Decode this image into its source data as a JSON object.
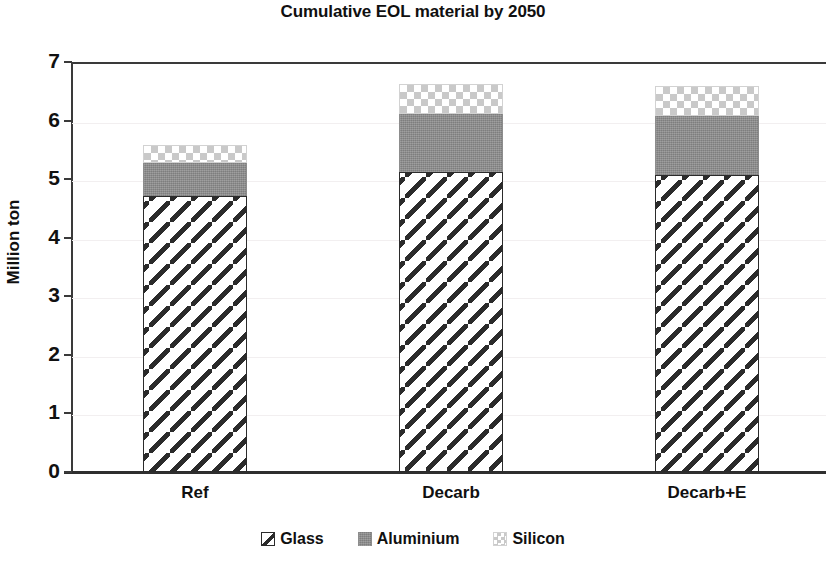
{
  "chart_data": {
    "type": "bar",
    "title": "Cumulative EOL material by 2050",
    "xlabel": "",
    "ylabel": "Million ton",
    "ylim": [
      0,
      7
    ],
    "yticks": [
      0,
      1,
      2,
      3,
      4,
      5,
      6,
      7
    ],
    "ytick_labels": [
      "0",
      "1",
      "2",
      "3",
      "4",
      "5",
      "6",
      "7"
    ],
    "grid": true,
    "stacked": true,
    "legend_position": "bottom",
    "categories": [
      "Ref",
      "Decarb",
      "Decarb+E"
    ],
    "series": [
      {
        "name": "Glass",
        "values": [
          4.71,
          5.12,
          5.07
        ]
      },
      {
        "name": "Aluminium",
        "values": [
          0.56,
          1.0,
          1.01
        ]
      },
      {
        "name": "Silicon",
        "values": [
          0.31,
          0.5,
          0.51
        ]
      }
    ],
    "totals": [
      5.58,
      6.62,
      6.59
    ],
    "units": "Million ton"
  },
  "legend": {
    "items": [
      {
        "label": "Glass",
        "swatch": "glass-hatch-swatch"
      },
      {
        "label": "Aluminium",
        "swatch": "aluminium-solid-swatch"
      },
      {
        "label": "Silicon",
        "swatch": "silicon-checker-swatch"
      }
    ]
  }
}
